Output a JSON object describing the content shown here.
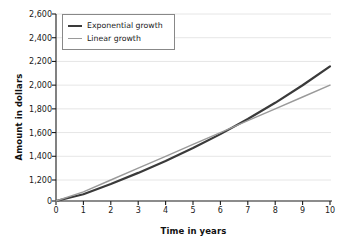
{
  "chart_data": {
    "type": "line",
    "title": "",
    "xlabel": "Time in years",
    "ylabel": "Amount in dollars",
    "xlim": [
      0,
      10
    ],
    "ylim": [
      0,
      2600
    ],
    "y_axis_break": true,
    "y_break_note": "axis jumps from 0 directly to 1,200",
    "grid": true,
    "grid_axis": "y",
    "legend_position": "top-left",
    "x_tick_labels": [
      "0",
      "1",
      "2",
      "3",
      "4",
      "5",
      "6",
      "7",
      "8",
      "9",
      "10"
    ],
    "y_tick_labels": [
      "0",
      "1,200",
      "1,400",
      "1,600",
      "1,800",
      "2,000",
      "2,200",
      "2,400",
      "2,600"
    ],
    "y_tick_values": [
      0,
      1200,
      1400,
      1600,
      1800,
      2000,
      2200,
      2400,
      2600
    ],
    "x": [
      0,
      1,
      2,
      3,
      4,
      5,
      6,
      7,
      8,
      9,
      10
    ],
    "series": [
      {
        "name": "Exponential growth",
        "color": "#3a3a3a",
        "width": 2.2,
        "values": [
          1000,
          1080,
          1166,
          1260,
          1360,
          1469,
          1587,
          1714,
          1851,
          1999,
          2159
        ]
      },
      {
        "name": "Linear growth",
        "color": "#9a9a9a",
        "width": 1.4,
        "values": [
          1000,
          1100,
          1200,
          1300,
          1400,
          1500,
          1600,
          1700,
          1800,
          1900,
          2000
        ]
      }
    ]
  },
  "colors": {
    "exponential": "#3a3a3a",
    "linear": "#9a9a9a",
    "axis": "#1a1a1a",
    "grid": "#e6e6e6",
    "legend_border": "#888888",
    "background": "#ffffff"
  }
}
